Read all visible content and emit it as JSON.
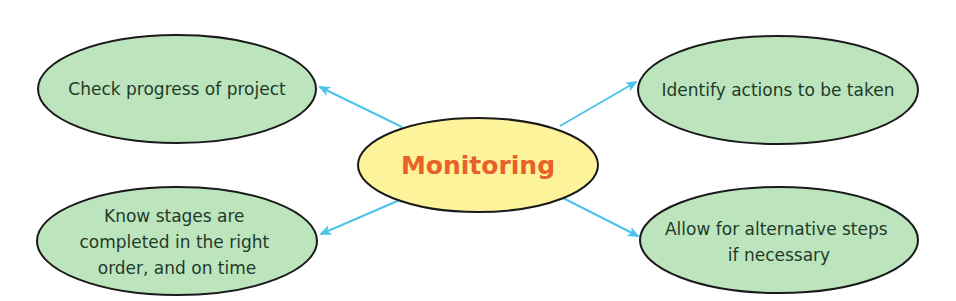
{
  "colors": {
    "center_fill": "#fdf39a",
    "center_text": "#e9602a",
    "node_fill": "#bde5bd",
    "node_stroke": "#1a1a1a",
    "node_text": "#1f3a2a",
    "arrow": "#4cc3ea"
  },
  "center": {
    "label": "Monitoring"
  },
  "nodes": [
    {
      "id": "top-left",
      "lines": [
        "Check progress of project"
      ]
    },
    {
      "id": "bottom-left",
      "lines": [
        "Know stages are",
        "completed in the right",
        "order, and on time"
      ]
    },
    {
      "id": "top-right",
      "lines": [
        "Identify actions to be taken"
      ]
    },
    {
      "id": "bottom-right",
      "lines": [
        "Allow for alternative steps",
        "if necessary"
      ]
    }
  ]
}
